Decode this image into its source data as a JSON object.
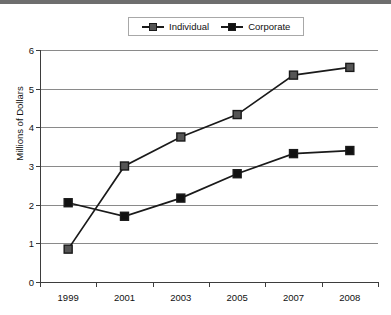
{
  "chart_data": {
    "type": "line",
    "title": "",
    "xlabel": "",
    "ylabel": "Millions of Dollars",
    "categories": [
      "1999",
      "2001",
      "2003",
      "2005",
      "2007",
      "2008"
    ],
    "ylim": [
      0,
      6
    ],
    "ytick_labels": [
      "0",
      "1",
      "2",
      "3",
      "4",
      "5",
      "6"
    ],
    "ytick_values": [
      0,
      1,
      2,
      3,
      4,
      5,
      6
    ],
    "grid": true,
    "legend_position": "top-center",
    "series": [
      {
        "name": "Individual",
        "values": [
          0.85,
          3.0,
          3.75,
          4.33,
          5.35,
          5.55
        ],
        "color": "#1a1a1a",
        "marker": "square",
        "marker_fill": "#555555"
      },
      {
        "name": "Corporate",
        "values": [
          2.05,
          1.7,
          2.17,
          2.8,
          3.32,
          3.4
        ],
        "color": "#1a1a1a",
        "marker": "square",
        "marker_fill": "#111111"
      }
    ]
  },
  "legend": {
    "items": [
      {
        "label": "Individual"
      },
      {
        "label": "Corporate"
      }
    ]
  },
  "colors": {
    "top_band": "#6e6e6e",
    "gridline": "#8a8a8a",
    "axis": "#3d3d3d",
    "text": "#111111",
    "background": "#ffffff"
  }
}
